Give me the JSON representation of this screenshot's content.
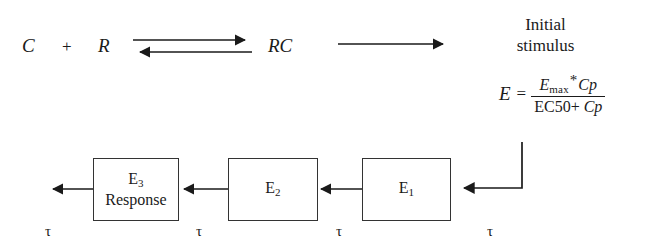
{
  "figure": {
    "background_color": "#ffffff",
    "ink_color": "#1a1a1a",
    "box_border_color": "#333333"
  },
  "reaction": {
    "reactant_drug": "C",
    "plus": "+",
    "reactant_receptor": "R",
    "complex": "RC",
    "equilibrium_arrow": "double-headed-equilibrium-arrow",
    "forward_arrow": "right-arrow"
  },
  "stimulus": {
    "line1": "Initial",
    "line2": "stimulus"
  },
  "equation": {
    "lhs": "E",
    "equals": "=",
    "numerator": {
      "base": "E",
      "subscript": "max",
      "operator": "*",
      "term": "Cp"
    },
    "denominator": {
      "constant": "EC50",
      "operator": "+",
      "term": "Cp"
    },
    "plain_text": "E = (Emax * Cp) / (EC50 + Cp)"
  },
  "compartments": [
    {
      "name": "compartment-e3",
      "label_base": "E",
      "label_subscript": "3",
      "sublabel": "Response"
    },
    {
      "name": "compartment-e2",
      "label_base": "E",
      "label_subscript": "2",
      "sublabel": ""
    },
    {
      "name": "compartment-e1",
      "label_base": "E",
      "label_subscript": "1",
      "sublabel": ""
    }
  ],
  "transit_delays": [
    {
      "symbol": "τ"
    },
    {
      "symbol": "τ"
    },
    {
      "symbol": "τ"
    },
    {
      "symbol": "τ"
    }
  ],
  "connectors": {
    "output_arrow": "left-arrow",
    "e2_to_e3_arrow": "left-arrow",
    "e1_to_e2_arrow": "left-arrow",
    "stimulus_to_e1_arrow": "elbow-left-arrow"
  }
}
